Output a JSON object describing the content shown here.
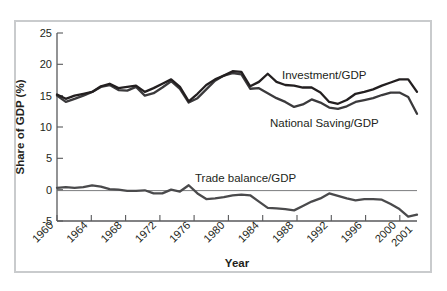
{
  "figure": {
    "border_color": "#c9cbcd",
    "background": "#ffffff"
  },
  "axes": {
    "y_title": "Share of GDP (%)",
    "x_title": "Year",
    "y_ticks": [
      "25",
      "20",
      "15",
      "10",
      "5",
      "0",
      "-5"
    ],
    "x_ticks": [
      "1960",
      "1964",
      "1968",
      "1972",
      "1976",
      "1980",
      "1984",
      "1988",
      "1992",
      "1996",
      "2000",
      "2001"
    ]
  },
  "annotations": {
    "investment_label": "Investment/GDP",
    "saving_label": "National Saving/GDP",
    "trade_label": "Trade balance/GDP"
  },
  "chart_data": {
    "type": "line",
    "title": "",
    "xlabel": "Year",
    "ylabel": "Share of GDP (%)",
    "xlim": [
      1960,
      2001
    ],
    "ylim": [
      -5,
      25
    ],
    "ytick_step": 5,
    "grid": false,
    "legend": "inline-annotations",
    "x": [
      1960,
      1961,
      1962,
      1963,
      1964,
      1965,
      1966,
      1967,
      1968,
      1969,
      1970,
      1971,
      1972,
      1973,
      1974,
      1975,
      1976,
      1977,
      1978,
      1979,
      1980,
      1981,
      1982,
      1983,
      1984,
      1985,
      1986,
      1987,
      1988,
      1989,
      1990,
      1991,
      1992,
      1993,
      1994,
      1995,
      1996,
      1997,
      1998,
      1999,
      2000,
      2001
    ],
    "series": [
      {
        "name": "Investment/GDP",
        "color": "#231f20",
        "values": [
          15.2,
          14.5,
          15.0,
          15.3,
          15.6,
          16.5,
          16.9,
          16.2,
          16.4,
          16.6,
          15.6,
          16.2,
          16.9,
          17.6,
          16.4,
          14.1,
          15.3,
          16.7,
          17.6,
          18.2,
          18.9,
          18.8,
          16.5,
          17.2,
          18.5,
          17.2,
          16.7,
          16.6,
          16.3,
          16.3,
          15.5,
          14.0,
          13.7,
          14.3,
          15.3,
          15.6,
          16.0,
          16.6,
          17.1,
          17.6,
          17.6,
          15.6
        ]
      },
      {
        "name": "National Saving/GDP",
        "color": "#3b3a3c",
        "values": [
          15.0,
          14.0,
          14.5,
          15.0,
          15.6,
          16.4,
          16.7,
          15.9,
          15.8,
          16.4,
          15.0,
          15.4,
          16.3,
          17.3,
          16.1,
          13.9,
          14.6,
          16.0,
          17.4,
          18.2,
          18.6,
          18.4,
          16.1,
          16.2,
          15.4,
          14.6,
          14.0,
          13.2,
          13.6,
          14.4,
          13.9,
          13.1,
          12.9,
          13.3,
          14.0,
          14.3,
          14.6,
          15.1,
          15.5,
          15.5,
          14.8,
          12.1
        ]
      },
      {
        "name": "Trade balance/GDP",
        "color": "#4a4a4c",
        "values": [
          0.3,
          0.4,
          0.3,
          0.4,
          0.7,
          0.5,
          0.1,
          0.0,
          -0.2,
          -0.2,
          -0.1,
          -0.6,
          -0.6,
          0.0,
          -0.3,
          0.7,
          -0.6,
          -1.5,
          -1.4,
          -1.2,
          -0.9,
          -0.8,
          -0.9,
          -1.9,
          -2.9,
          -3.0,
          -3.1,
          -3.3,
          -2.6,
          -1.9,
          -1.4,
          -0.6,
          -1.0,
          -1.4,
          -1.7,
          -1.5,
          -1.5,
          -1.6,
          -2.3,
          -3.1,
          -4.3,
          -4.0
        ]
      }
    ]
  }
}
